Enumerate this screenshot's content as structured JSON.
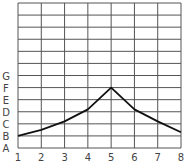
{
  "chart_data": {
    "type": "line",
    "title": "",
    "xlabel": "",
    "ylabel": "",
    "x": [
      1,
      2,
      3,
      4,
      5,
      6,
      7,
      8
    ],
    "x_tick_labels": [
      "1",
      "2",
      "3",
      "4",
      "5",
      "6",
      "7",
      "8"
    ],
    "y_tick_labels": [
      "A",
      "B",
      "C",
      "D",
      "E",
      "F",
      "G"
    ],
    "y_label_note": "A=0, B=1, C=2, D=3, E=4, F=5, G=6 (grid units)",
    "series": [
      {
        "name": "series",
        "values": [
          1.0,
          1.5,
          2.2,
          3.2,
          5.0,
          3.2,
          2.2,
          1.3
        ]
      }
    ],
    "ylim": [
      0,
      12
    ],
    "xlim": [
      1,
      8
    ],
    "grid": true,
    "legend": "none"
  }
}
